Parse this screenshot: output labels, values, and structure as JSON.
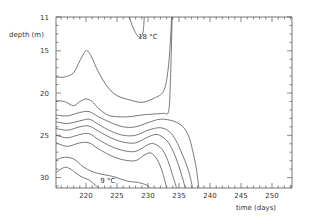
{
  "chart_data": {
    "type": "contour",
    "title": "",
    "xlabel": "time (days)",
    "ylabel": "depth (m)",
    "xlim": [
      215.2,
      253.2
    ],
    "ylim": [
      11,
      32.2
    ],
    "y_inverted": true,
    "grid": false,
    "x_ticks": [
      220,
      225,
      230,
      235,
      240,
      245,
      250
    ],
    "y_ticks": [
      11,
      15,
      20,
      25,
      30
    ],
    "annotations": [
      {
        "text": "18 °C",
        "day": 228.4,
        "depth": 13.3
      },
      {
        "text": "9 °C",
        "day": 222.3,
        "depth": 30.3
      }
    ],
    "series": [
      {
        "name": "18C",
        "points": [
          [
            227.0,
            11
          ],
          [
            227.6,
            12.3
          ],
          [
            228.3,
            13.2
          ],
          [
            228.8,
            13.4
          ],
          [
            229.2,
            12.8
          ],
          [
            229.4,
            11
          ]
        ]
      },
      {
        "name": "17C",
        "points": [
          [
            215.2,
            18.1
          ],
          [
            216.5,
            18.1
          ],
          [
            218,
            17.6
          ],
          [
            219,
            16.2
          ],
          [
            220,
            15.0
          ],
          [
            220.8,
            15.6
          ],
          [
            222,
            17.5
          ],
          [
            223.5,
            19.3
          ],
          [
            225,
            20.3
          ],
          [
            227,
            20.8
          ],
          [
            229,
            21.1
          ],
          [
            231,
            20.6
          ],
          [
            232.5,
            19.8
          ],
          [
            233.2,
            17.5
          ],
          [
            233.6,
            14
          ],
          [
            233.8,
            11
          ]
        ]
      },
      {
        "name": "16C",
        "points": [
          [
            215.2,
            20.9
          ],
          [
            216.5,
            21.0
          ],
          [
            218,
            21.5
          ],
          [
            219,
            21.0
          ],
          [
            220,
            20.7
          ],
          [
            221,
            21.0
          ],
          [
            222,
            21.8
          ],
          [
            223.5,
            22.6
          ],
          [
            225,
            22.8
          ],
          [
            227,
            22.8
          ],
          [
            229,
            22.6
          ],
          [
            230.5,
            22.5
          ],
          [
            232.5,
            22.4
          ],
          [
            233.3,
            22.2
          ],
          [
            233.6,
            19
          ],
          [
            233.9,
            11
          ]
        ]
      },
      {
        "name": "15C",
        "points": [
          [
            215.2,
            22.6
          ],
          [
            217,
            22.7
          ],
          [
            219,
            22.3
          ],
          [
            220.5,
            22.2
          ],
          [
            222,
            22.8
          ],
          [
            224,
            23.5
          ],
          [
            226,
            24.0
          ],
          [
            228,
            24.0
          ],
          [
            230,
            23.5
          ],
          [
            232,
            23.1
          ],
          [
            234,
            23.3
          ],
          [
            235.5,
            23.9
          ],
          [
            236.5,
            25
          ],
          [
            237.2,
            26.8
          ],
          [
            237.8,
            29
          ],
          [
            238.2,
            31.2
          ]
        ]
      },
      {
        "name": "14C",
        "points": [
          [
            215.2,
            23.4
          ],
          [
            217,
            23.6
          ],
          [
            219,
            23.3
          ],
          [
            220.5,
            23.1
          ],
          [
            222,
            23.7
          ],
          [
            224,
            24.5
          ],
          [
            226,
            25.0
          ],
          [
            228,
            25.0
          ],
          [
            230,
            24.4
          ],
          [
            232,
            24.1
          ],
          [
            233.5,
            24.6
          ],
          [
            234.5,
            25.6
          ],
          [
            235.5,
            27.2
          ],
          [
            236.5,
            29.1
          ],
          [
            237.2,
            31.2
          ]
        ]
      },
      {
        "name": "13C",
        "points": [
          [
            215.2,
            24.2
          ],
          [
            217,
            24.4
          ],
          [
            219,
            24.0
          ],
          [
            220.5,
            23.9
          ],
          [
            222,
            24.5
          ],
          [
            224,
            25.3
          ],
          [
            226,
            25.8
          ],
          [
            228,
            25.9
          ],
          [
            230,
            25.2
          ],
          [
            231.5,
            24.9
          ],
          [
            233,
            25.6
          ],
          [
            234,
            26.8
          ],
          [
            235,
            28.7
          ],
          [
            236,
            31.2
          ]
        ]
      },
      {
        "name": "12C",
        "points": [
          [
            215.2,
            25.0
          ],
          [
            217,
            25.3
          ],
          [
            219,
            24.9
          ],
          [
            220.5,
            24.8
          ],
          [
            222,
            25.5
          ],
          [
            224,
            26.3
          ],
          [
            226,
            26.8
          ],
          [
            228,
            26.9
          ],
          [
            230,
            26.1
          ],
          [
            231,
            26.0
          ],
          [
            232.3,
            26.7
          ],
          [
            233.2,
            28.0
          ],
          [
            234,
            29.8
          ],
          [
            234.6,
            31.2
          ]
        ]
      },
      {
        "name": "11C",
        "points": [
          [
            215.2,
            25.9
          ],
          [
            217,
            26.3
          ],
          [
            219,
            25.9
          ],
          [
            220.5,
            25.9
          ],
          [
            222,
            26.6
          ],
          [
            224,
            27.4
          ],
          [
            226,
            27.9
          ],
          [
            228,
            28.0
          ],
          [
            229.5,
            27.3
          ],
          [
            230.5,
            27.1
          ],
          [
            231.5,
            27.9
          ],
          [
            232.3,
            29.3
          ],
          [
            233,
            31.2
          ]
        ]
      },
      {
        "name": "10C",
        "points": [
          [
            215.2,
            27.9
          ],
          [
            216.5,
            27.6
          ],
          [
            218,
            27.8
          ],
          [
            219.5,
            28.7
          ],
          [
            221,
            29.3
          ],
          [
            222.5,
            29.6
          ],
          [
            224.5,
            29.9
          ],
          [
            226.5,
            30.4
          ],
          [
            228.5,
            30.6
          ],
          [
            229.8,
            30.9
          ],
          [
            230.3,
            31.2
          ]
        ]
      },
      {
        "name": "9C",
        "points": [
          [
            215.2,
            29.4
          ],
          [
            216.5,
            28.8
          ],
          [
            217.5,
            29.0
          ],
          [
            219,
            29.8
          ],
          [
            220.5,
            30.3
          ],
          [
            221.5,
            30.9
          ],
          [
            222.1,
            31.2
          ]
        ]
      }
    ]
  }
}
